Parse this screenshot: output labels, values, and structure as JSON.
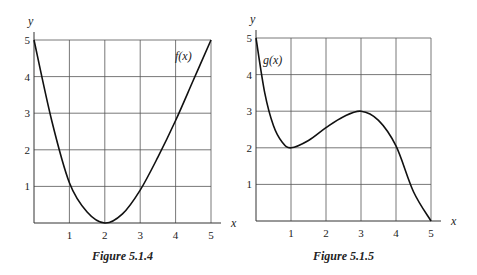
{
  "chart_data": [
    {
      "type": "line",
      "title": "Figure 5.1.4",
      "xlabel": "x",
      "ylabel": "y",
      "curve_label": "f(x)",
      "xlim": [
        0,
        5
      ],
      "ylim": [
        0,
        5
      ],
      "grid": true,
      "x_ticks": [
        "1",
        "2",
        "3",
        "4",
        "5"
      ],
      "y_ticks": [
        "1",
        "2",
        "3",
        "4",
        "5"
      ],
      "x": [
        0,
        0.5,
        1,
        1.5,
        2,
        2.5,
        3,
        3.5,
        4,
        4.5,
        5
      ],
      "values": [
        5,
        2.8,
        1.1,
        0.3,
        0,
        0.25,
        0.9,
        1.8,
        2.8,
        3.9,
        5
      ]
    },
    {
      "type": "line",
      "title": "Figure 5.1.5",
      "xlabel": "x",
      "ylabel": "y",
      "curve_label": "g(x)",
      "xlim": [
        0,
        5
      ],
      "ylim": [
        0,
        5
      ],
      "grid": true,
      "x_ticks": [
        "1",
        "2",
        "3",
        "4",
        "5"
      ],
      "y_ticks": [
        "1",
        "2",
        "3",
        "4",
        "5"
      ],
      "x": [
        0,
        0.25,
        0.5,
        0.75,
        1,
        1.5,
        2,
        2.5,
        3,
        3.5,
        4,
        4.5,
        5
      ],
      "values": [
        5,
        3.5,
        2.6,
        2.15,
        2,
        2.2,
        2.55,
        2.85,
        3,
        2.75,
        2.05,
        0.8,
        0
      ]
    }
  ]
}
